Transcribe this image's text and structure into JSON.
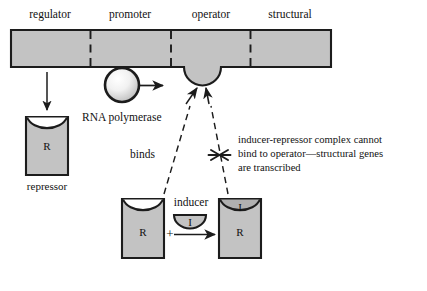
{
  "diagram": {
    "colors": {
      "fill_gray": "#c3c3c3",
      "outline": "#1c1c1c",
      "background": "#ffffff",
      "text": "#111111"
    },
    "dna_bar": {
      "name": "dna-strand",
      "segments": [
        {
          "id": "regulator",
          "label": "regulator"
        },
        {
          "id": "promoter",
          "label": "promoter"
        },
        {
          "id": "operator",
          "label": "operator"
        },
        {
          "id": "structural",
          "label": "structural"
        }
      ]
    },
    "repressor": {
      "shape_label": "R",
      "caption": "repressor"
    },
    "rna_polymerase": {
      "label": "RNA polymerase"
    },
    "binds_label": "binds",
    "inducer": {
      "label": "inducer",
      "shape_label": "I"
    },
    "complex": {
      "free_repressor_label": "R",
      "bound_repressor_label": "R",
      "bound_inducer_label": "I",
      "plus_sign": "+"
    },
    "annotation": {
      "line1": "inducer-repressor complex cannot",
      "line2": "bind to operator—structural genes",
      "line3": "are transcribed"
    }
  }
}
